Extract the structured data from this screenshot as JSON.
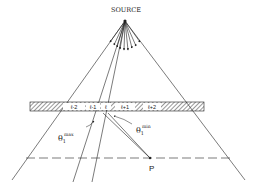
{
  "diagram": {
    "source_label": "SOURCE",
    "point_label": "P",
    "theta_max": {
      "symbol": "θ",
      "sub": "1",
      "sup": "max"
    },
    "theta_min": {
      "symbol": "θ",
      "sub": "1",
      "sup": "min"
    },
    "cells": [
      {
        "label": "ℓ-2"
      },
      {
        "label": "ℓ-1"
      },
      {
        "label": "ℓ"
      },
      {
        "label": "ℓ+1"
      },
      {
        "label": "ℓ+2"
      }
    ],
    "colors": {
      "ink": "#222222",
      "background": "#ffffff"
    }
  }
}
